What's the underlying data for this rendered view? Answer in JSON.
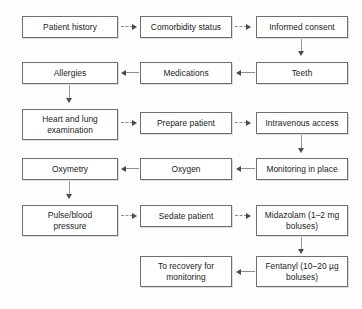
{
  "diagram": {
    "background_color": "#fdfdfd",
    "box_border_color": "#6e6e6e",
    "arrow_color": "#8d8d8d",
    "arrowhead_color": "#4a4a4a",
    "nodes": [
      {
        "id": "patient-history",
        "label": "Patient history",
        "row": 1,
        "column": "left"
      },
      {
        "id": "comorbidity-status",
        "label": "Comorbidity status",
        "row": 1,
        "column": "middle"
      },
      {
        "id": "informed-consent",
        "label": "Informed consent",
        "row": 1,
        "column": "right"
      },
      {
        "id": "allergies",
        "label": "Allergies",
        "row": 2,
        "column": "left"
      },
      {
        "id": "medications",
        "label": "Medications",
        "row": 2,
        "column": "middle"
      },
      {
        "id": "teeth",
        "label": "Teeth",
        "row": 2,
        "column": "right"
      },
      {
        "id": "heart-and-lung-examination",
        "label_line1": "Heart and lung",
        "label_line2": "examination",
        "row": 3,
        "column": "left"
      },
      {
        "id": "prepare-patient",
        "label": "Prepare patient",
        "row": 3,
        "column": "middle"
      },
      {
        "id": "intravenous-access",
        "label": "Intravenous access",
        "row": 3,
        "column": "right"
      },
      {
        "id": "oxymetry",
        "label": "Oxymetry",
        "row": 4,
        "column": "left"
      },
      {
        "id": "oxygen",
        "label": "Oxygen",
        "row": 4,
        "column": "middle"
      },
      {
        "id": "monitoring-in-place",
        "label": "Monitoring in place",
        "row": 4,
        "column": "right"
      },
      {
        "id": "pulse-blood-pressure",
        "label_line1": "Pulse/blood",
        "label_line2": "pressure",
        "row": 5,
        "column": "left"
      },
      {
        "id": "sedate-patient",
        "label": "Sedate patient",
        "row": 5,
        "column": "middle"
      },
      {
        "id": "midazolam",
        "label_line1": "Midazolam (1–2 mg",
        "label_line2": "boluses)",
        "row": 5,
        "column": "right"
      },
      {
        "id": "to-recovery-for-monitoring",
        "label_line1": "To recovery for",
        "label_line2": "monitoring",
        "row": 6,
        "column": "middle"
      },
      {
        "id": "fentanyl",
        "label_line1": "Fentanyl (10–20 µg",
        "label_line2": "boluses)",
        "row": 6,
        "column": "right"
      }
    ],
    "edges": [
      {
        "id": "edge-patient-history-to-comorbidity-status",
        "from": "patient-history",
        "to": "comorbidity-status",
        "direction": "right",
        "style": "dotted"
      },
      {
        "id": "edge-comorbidity-status-to-informed-consent",
        "from": "comorbidity-status",
        "to": "informed-consent",
        "direction": "right",
        "style": "dotted"
      },
      {
        "id": "edge-informed-consent-to-teeth",
        "from": "informed-consent",
        "to": "teeth",
        "direction": "down",
        "style": "solid"
      },
      {
        "id": "edge-teeth-to-medications",
        "from": "teeth",
        "to": "medications",
        "direction": "left",
        "style": "solid"
      },
      {
        "id": "edge-medications-to-allergies",
        "from": "medications",
        "to": "allergies",
        "direction": "left",
        "style": "solid"
      },
      {
        "id": "edge-allergies-to-heart-and-lung-examination",
        "from": "allergies",
        "to": "heart-and-lung-examination",
        "direction": "down",
        "style": "solid"
      },
      {
        "id": "edge-heart-and-lung-examination-to-prepare-patient",
        "from": "heart-and-lung-examination",
        "to": "prepare-patient",
        "direction": "right",
        "style": "dotted"
      },
      {
        "id": "edge-prepare-patient-to-intravenous-access",
        "from": "prepare-patient",
        "to": "intravenous-access",
        "direction": "right",
        "style": "dotted"
      },
      {
        "id": "edge-intravenous-access-to-monitoring-in-place",
        "from": "intravenous-access",
        "to": "monitoring-in-place",
        "direction": "down",
        "style": "solid"
      },
      {
        "id": "edge-monitoring-in-place-to-oxygen",
        "from": "monitoring-in-place",
        "to": "oxygen",
        "direction": "left",
        "style": "solid"
      },
      {
        "id": "edge-oxygen-to-oxymetry",
        "from": "oxygen",
        "to": "oxymetry",
        "direction": "left",
        "style": "solid"
      },
      {
        "id": "edge-oxymetry-to-pulse-blood-pressure",
        "from": "oxymetry",
        "to": "pulse-blood-pressure",
        "direction": "down",
        "style": "solid"
      },
      {
        "id": "edge-pulse-blood-pressure-to-sedate-patient",
        "from": "pulse-blood-pressure",
        "to": "sedate-patient",
        "direction": "right",
        "style": "dotted"
      },
      {
        "id": "edge-sedate-patient-to-midazolam",
        "from": "sedate-patient",
        "to": "midazolam",
        "direction": "right",
        "style": "dotted"
      },
      {
        "id": "edge-midazolam-to-fentanyl",
        "from": "midazolam",
        "to": "fentanyl",
        "direction": "down",
        "style": "solid"
      },
      {
        "id": "edge-fentanyl-to-to-recovery-for-monitoring",
        "from": "fentanyl",
        "to": "to-recovery-for-monitoring",
        "direction": "left",
        "style": "solid"
      }
    ]
  }
}
